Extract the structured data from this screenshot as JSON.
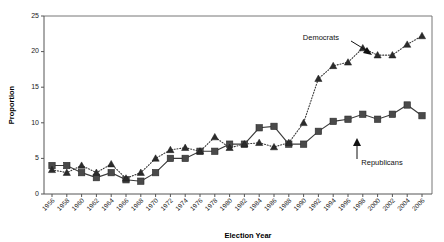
{
  "chart_data": {
    "type": "line",
    "title": "",
    "xlabel": "Election Year",
    "ylabel": "Proportion",
    "xlim": [
      1955,
      2007
    ],
    "ylim": [
      0,
      25
    ],
    "grid": false,
    "legend_position": "inline-annotations",
    "x": [
      1956,
      1958,
      1960,
      1962,
      1964,
      1966,
      1968,
      1970,
      1972,
      1974,
      1976,
      1978,
      1980,
      1982,
      1984,
      1986,
      1988,
      1990,
      1992,
      1994,
      1996,
      1998,
      2000,
      2002,
      2004,
      2006
    ],
    "xtick_labels": [
      "1956",
      "1958",
      "1960",
      "1962",
      "1964",
      "1966",
      "1968",
      "1970",
      "1972",
      "1974",
      "1976",
      "1978",
      "1980",
      "1982",
      "1984",
      "1986",
      "1988",
      "1990",
      "1992",
      "1994",
      "1996",
      "1998",
      "2000",
      "2002",
      "2004",
      "2006"
    ],
    "ytick_labels": [
      "0",
      "5",
      "10",
      "15",
      "20",
      "25"
    ],
    "yticks": [
      0,
      5,
      10,
      15,
      20,
      25
    ],
    "series": [
      {
        "name": "Republicans",
        "marker": "square",
        "linestyle": "solid",
        "color": "#4a4a4a",
        "values": [
          4.0,
          4.0,
          3.0,
          2.3,
          3.0,
          2.0,
          1.8,
          3.0,
          5.0,
          5.0,
          6.0,
          6.0,
          7.0,
          7.0,
          9.3,
          9.5,
          7.0,
          7.0,
          8.8,
          10.2,
          10.5,
          11.2,
          10.5,
          11.2,
          12.5,
          11.0
        ]
      },
      {
        "name": "Democrats",
        "marker": "triangle",
        "linestyle": "dotted",
        "color": "#2b2b2b",
        "values": [
          3.4,
          3.0,
          4.0,
          3.0,
          4.2,
          2.2,
          3.0,
          5.0,
          6.2,
          6.5,
          6.0,
          8.0,
          6.5,
          7.0,
          7.2,
          6.6,
          7.2,
          10.0,
          16.2,
          18.0,
          18.5,
          20.5,
          19.5,
          19.5,
          21.0,
          22.2
        ]
      }
    ],
    "annotations": [
      {
        "name": "democrats-label",
        "text": "Democrats",
        "x": 1994,
        "y": 22.3
      },
      {
        "name": "republicans-label",
        "text": "Republicans",
        "x": 2000,
        "y": 4.2
      }
    ]
  }
}
